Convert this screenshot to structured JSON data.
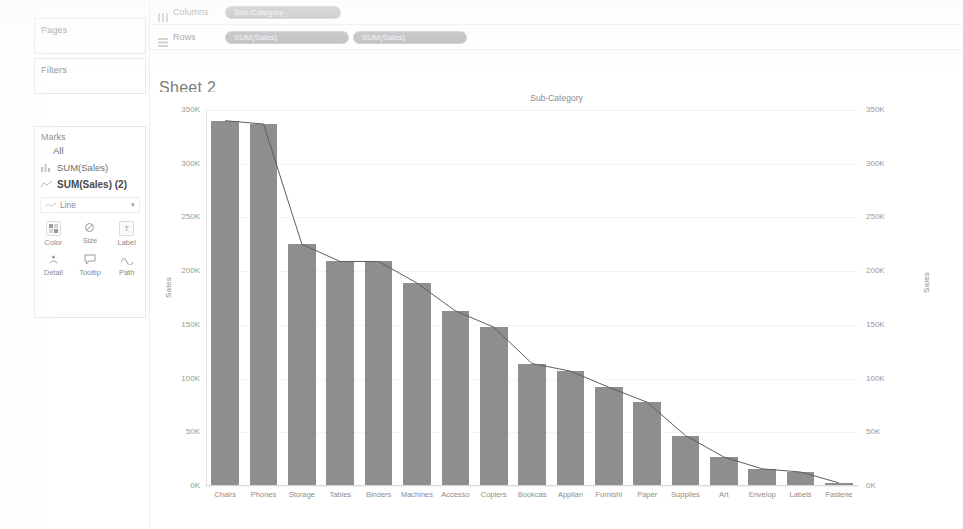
{
  "app": {
    "sheet_title": "Sheet 2"
  },
  "left_panel": {
    "pages_label": "Pages",
    "filters_label": "Filters",
    "marks": {
      "title": "Marks",
      "all_label": "All",
      "cards": [
        {
          "label": "SUM(Sales)",
          "icon": "bar-chart-icon",
          "bold": false
        },
        {
          "label": "SUM(Sales) (2)",
          "icon": "line-chart-icon",
          "bold": true
        }
      ],
      "mark_type": "Line",
      "mark_type_icon": "line-mark-icon",
      "properties": [
        {
          "label": "Color",
          "icon": "color-icon"
        },
        {
          "label": "Size",
          "icon": "size-icon"
        },
        {
          "label": "Label",
          "icon": "label-icon"
        },
        {
          "label": "Detail",
          "icon": "detail-icon"
        },
        {
          "label": "Tooltip",
          "icon": "tooltip-icon"
        },
        {
          "label": "Path",
          "icon": "path-icon"
        }
      ]
    }
  },
  "shelves": {
    "columns": {
      "label": "Columns",
      "icon": "columns-icon",
      "pills": [
        {
          "label": "Sub-Category"
        }
      ]
    },
    "rows": {
      "label": "Rows",
      "icon": "rows-icon",
      "pills": [
        {
          "label": "SUM(Sales)"
        },
        {
          "label": "SUM(Sales)"
        }
      ]
    }
  },
  "colors": {
    "bar": "#8e8e8e",
    "line": "#5f5f5f",
    "pill": "#b4b4b4",
    "text": "#8d8d8d",
    "grid": "#f4f4f4"
  },
  "chart_data": {
    "type": "bar",
    "title": "Sheet 2",
    "column_header": "Sub-Category",
    "xlabel": "Sub-Category",
    "ylabel": "Sales",
    "y_right_label": "Sales",
    "ylim": [
      0,
      350000
    ],
    "ytick_labels": [
      "0K",
      "50K",
      "100K",
      "150K",
      "200K",
      "250K",
      "300K",
      "350K"
    ],
    "ytick_values": [
      0,
      50000,
      100000,
      150000,
      200000,
      250000,
      300000,
      350000
    ],
    "grid": true,
    "legend": "none",
    "categories": [
      "Chairs",
      "Phones",
      "Storage",
      "Tables",
      "Binders",
      "Machines",
      "Accesso",
      "Copiers",
      "Bookcas",
      "Applian",
      "Furnishi",
      "Paper",
      "Supplies",
      "Art",
      "Envelop",
      "Labels",
      "Fastene"
    ],
    "series": [
      {
        "name": "SUM(Sales)",
        "mark": "bar",
        "values": [
          340000,
          337000,
          225000,
          209000,
          209000,
          189000,
          163000,
          148000,
          114000,
          107000,
          92000,
          78000,
          47000,
          27000,
          16000,
          13000,
          3000
        ]
      },
      {
        "name": "SUM(Sales) (2)",
        "mark": "line",
        "values": [
          340000,
          337000,
          225000,
          209000,
          209000,
          189000,
          163000,
          148000,
          114000,
          107000,
          92000,
          78000,
          47000,
          27000,
          16000,
          13000,
          3000
        ]
      }
    ]
  }
}
